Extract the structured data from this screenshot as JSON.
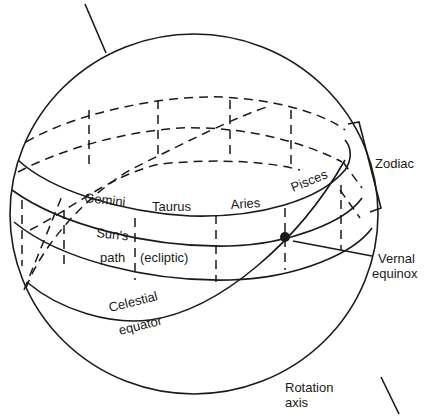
{
  "diagram": {
    "colors": {
      "ink": "#1a1a1a",
      "background": "#ffffff"
    },
    "labels": {
      "zodiac": "Zodiac",
      "vernal_1": "Vernal",
      "vernal_2": "equinox",
      "rotation_1": "Rotation",
      "rotation_2": "axis",
      "suns": "Sun's",
      "path": "path",
      "ecliptic": "(ecliptic)",
      "celestial": "Celestial",
      "equator": "equator"
    },
    "constellations": [
      "Gemini",
      "Taurus",
      "Aries",
      "Pisces"
    ],
    "elements": {
      "sphere": "celestial-sphere-outline",
      "rotation_axis": "rotation-axis-line",
      "zodiac_band": "zodiac-band",
      "ecliptic": "suns-path-ecliptic",
      "celestial_equator": "celestial-equator",
      "vernal_equinox_point": "vernal-equinox-dot",
      "zodiac_bracket": "zodiac-bracket"
    }
  }
}
